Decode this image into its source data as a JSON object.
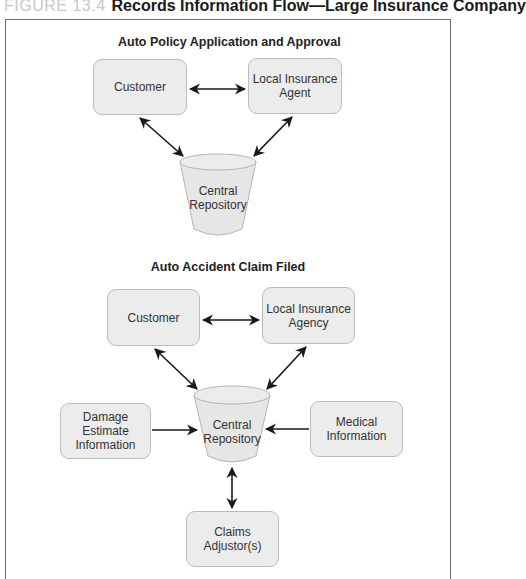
{
  "figure": {
    "number": "FIGURE 13.4",
    "title": "Records Information Flow—Large Insurance Company"
  },
  "sections": [
    {
      "title": "Auto Policy Application and Approval",
      "nodes": {
        "customer": "Customer",
        "agent_line1": "Local Insurance",
        "agent_line2": "Agent",
        "repo_line1": "Central",
        "repo_line2": "Repository"
      }
    },
    {
      "title": "Auto Accident Claim Filed",
      "nodes": {
        "customer": "Customer",
        "agency_line1": "Local Insurance",
        "agency_line2": "Agency",
        "repo_line1": "Central",
        "repo_line2": "Repository",
        "damage_line1": "Damage Estimate",
        "damage_line2": "Information",
        "medical_line1": "Medical",
        "medical_line2": "Information",
        "claims_line1": "Claims",
        "claims_line2": "Adjustor(s)"
      }
    }
  ],
  "colors": {
    "node_fill": "#ececec",
    "node_border": "#bcbcbc",
    "arrow": "#1a1a1a",
    "frame": "#6e6e6e",
    "figure_number": "#c9c9c9"
  }
}
